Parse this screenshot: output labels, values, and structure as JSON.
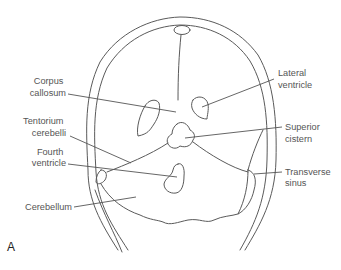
{
  "figure": {
    "panel_letter": "A",
    "view": "coronal section of skull and brain",
    "labels": {
      "corpus_callosum": [
        "Corpus",
        "callosum"
      ],
      "tentorium_cerebelli": [
        "Tentorium",
        "cerebelli"
      ],
      "fourth_ventricle": [
        "Fourth",
        "ventricle"
      ],
      "cerebellum": [
        "Cerebellum"
      ],
      "lateral_ventricle": [
        "Lateral",
        "ventricle"
      ],
      "superior_cistern": [
        "Superior",
        "cistern"
      ],
      "transverse_sinus": [
        "Transverse",
        "sinus"
      ]
    },
    "colors": {
      "line": "#5a5a5a",
      "label_text": "#555555",
      "background": "#ffffff"
    }
  }
}
